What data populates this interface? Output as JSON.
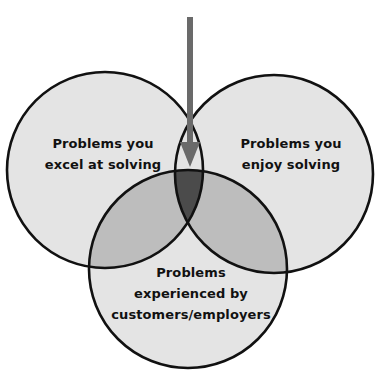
{
  "diagram": {
    "type": "venn",
    "circles": [
      {
        "id": "left",
        "label_lines": [
          "Problems you",
          "excel at solving"
        ]
      },
      {
        "id": "right",
        "label_lines": [
          "Problems you",
          "enjoy solving"
        ]
      },
      {
        "id": "bottom",
        "label_lines": [
          "Problems",
          "experienced by",
          "customers/employers"
        ]
      }
    ],
    "arrow": {
      "direction": "down",
      "points_to": "intersection of all three circles"
    },
    "colors": {
      "background": "#ffffff",
      "single_region": "#e4e4e4",
      "pair_overlap": "#bdbdbd",
      "triple_overlap": "#4b4b4b",
      "outline": "#111111",
      "arrow": "#6a6a6a"
    }
  }
}
